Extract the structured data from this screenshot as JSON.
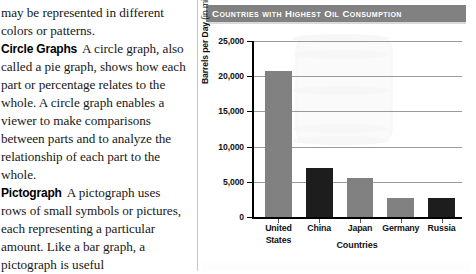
{
  "article": {
    "paragraphs": [
      {
        "lead": "",
        "text": "may be represented in different colors or patterns."
      },
      {
        "lead": "Circle Graphs",
        "text": "A circle graph, also called a pie graph, shows how each part or percentage relates to the whole. A circle graph enables a viewer to make comparisons between parts and to analyze the relationship of each part to the whole."
      },
      {
        "lead": "Pictograph",
        "text": "A pictograph uses rows of small symbols or pictures, each representing a particular amount. Like a bar graph, a pictograph is useful"
      }
    ]
  },
  "figure": {
    "title": "Countries with Highest Oil Consumption",
    "watermark": "oil-drum-watermark"
  },
  "chart_data": {
    "type": "bar",
    "title": "Countries with Highest Oil Consumption",
    "xlabel": "Countries",
    "ylabel": "Barrels per Day (in millions)",
    "ylabel_bold_part": "Barrels per Day",
    "ylabel_light_part": "(in millions)",
    "categories": [
      "United States",
      "China",
      "Japan",
      "Germany",
      "Russia"
    ],
    "values": [
      20700,
      7000,
      5500,
      2700,
      2700
    ],
    "ylim": [
      0,
      25000
    ],
    "ytick_values": [
      0,
      5000,
      10000,
      15000,
      20000,
      25000
    ],
    "ytick_labels": [
      "0",
      "5,000",
      "10,000",
      "15,000",
      "20,000",
      "25,000"
    ],
    "grid": true,
    "legend": "none",
    "bar_colors": [
      "#818181",
      "#1d1d1d",
      "#818181",
      "#818181",
      "#1d1d1d"
    ],
    "colors": {
      "bar_light": "#818181",
      "bar_dark": "#1d1d1d",
      "title_bar": "#818181",
      "title_text": "#ffffff",
      "gridline": "#9a9a9a",
      "axis": "#000000"
    }
  }
}
